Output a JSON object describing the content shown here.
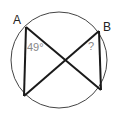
{
  "diagram": {
    "type": "inscribed-angles-circle",
    "circle": {
      "cx": 59,
      "cy": 60,
      "r": 48,
      "stroke": "#444444"
    },
    "points": {
      "A": {
        "x": 26,
        "y": 27,
        "label": "A"
      },
      "B": {
        "x": 99,
        "y": 31,
        "label": "B"
      },
      "C": {
        "x": 24,
        "y": 96
      },
      "D": {
        "x": 101,
        "y": 90
      }
    },
    "labels": {
      "A": "A",
      "B": "B",
      "angle_A": "49°",
      "angle_B": "?"
    },
    "colors": {
      "lines": "#1a1a1a",
      "labels": "#222222",
      "angle_text": "#888888"
    }
  }
}
